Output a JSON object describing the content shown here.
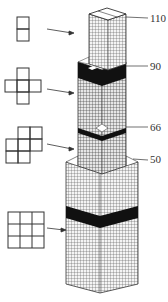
{
  "diagram": {
    "colors": {
      "line": "#333333",
      "band": "#111111",
      "background": "#ffffff"
    },
    "floor_labels": [
      {
        "text": "110",
        "y": 16
      },
      {
        "text": "90",
        "y": 64
      },
      {
        "text": "66",
        "y": 125
      },
      {
        "text": "50",
        "y": 157
      }
    ],
    "plan_views": [
      {
        "name": "plan-2-tubes",
        "cells": 2
      },
      {
        "name": "plan-cross-5-tubes",
        "cells": 5
      },
      {
        "name": "plan-7-tubes",
        "cells": 7
      },
      {
        "name": "plan-9-tubes",
        "cells": 9
      }
    ]
  }
}
